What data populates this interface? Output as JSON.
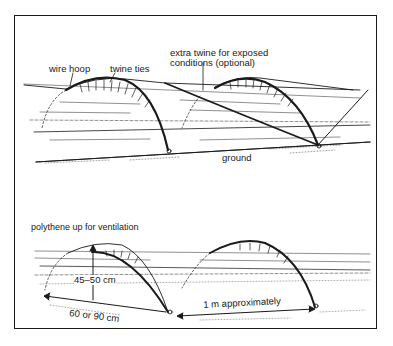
{
  "diagram": {
    "type": "cloche-tunnel-illustration",
    "panels": [
      {
        "id": "top",
        "labels": {
          "wire_hoop": "wire hoop",
          "twine_ties": "twine ties",
          "extra_twine_line1": "extra twine for exposed",
          "extra_twine_line2": "conditions (optional)",
          "ground": "ground"
        }
      },
      {
        "id": "bottom",
        "labels": {
          "ventilation": "polythene up for ventilation",
          "height": "45–50 cm",
          "width": "60 or 90 cm",
          "spacing": "1 m approximately"
        }
      }
    ],
    "colors": {
      "ink": "#1a1a1a",
      "background": "#ffffff"
    }
  }
}
